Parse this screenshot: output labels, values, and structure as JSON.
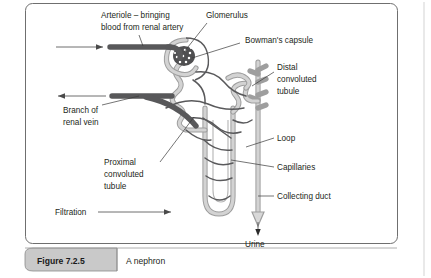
{
  "figure": {
    "panel_border_color": "#6f6f6f",
    "background": "#ffffff",
    "caption": {
      "tab_label": "Figure 7.2.5",
      "text": "A nephron",
      "tab_fill": "#c9c9c9"
    },
    "title_alt": "A nephron"
  },
  "labels": {
    "arteriole": "Arteriole – bringing\nblood from renal artery",
    "arteriole_line1": "Arteriole – bringing",
    "arteriole_line2": "blood from renal artery",
    "glomerulus": "Glomerulus",
    "bowmans_capsule": "Bowman's capsule",
    "distal_line1": "Distal",
    "distal_line2": "convoluted",
    "distal_line3": "tubule",
    "renal_vein_line1": "Branch of",
    "renal_vein_line2": "renal vein",
    "proximal_line1": "Proximal",
    "proximal_line2": "convoluted",
    "proximal_line3": "tubule",
    "loop": "Loop",
    "capillaries": "Capillaries",
    "collecting_duct": "Collecting duct",
    "filtration": "Filtration",
    "urine": "Urine"
  },
  "colors": {
    "tubule_outline": "#9e9e9e",
    "tubule_inner": "#d3d3d3",
    "capillary": "#59595b",
    "vessel_dark": "#58585a",
    "glomerulus_dark": "#4f4f51",
    "text": "#231f20",
    "leader": "#3a3a3a"
  },
  "flow": {
    "arteriole_direction": "right",
    "vein_direction": "left",
    "filtration_direction": "right",
    "urine_direction": "down"
  }
}
